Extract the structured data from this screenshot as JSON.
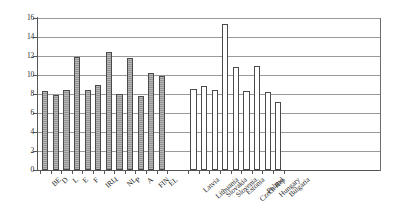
{
  "chart_data": {
    "type": "bar",
    "title": "",
    "xlabel": "",
    "ylabel": "",
    "ylim": [
      0,
      16
    ],
    "ytick_values": [
      0,
      2,
      4,
      6,
      8,
      10,
      12,
      14,
      16
    ],
    "ytick_labels": [
      "0",
      "2",
      "4",
      "6",
      "8",
      "10",
      "12",
      "14",
      "16"
    ],
    "grid": true,
    "legend": "none",
    "groups": [
      {
        "name": "EU Member States",
        "style": "filled-grey",
        "categories": [
          "BE",
          "D",
          "L",
          "E",
          "F",
          "IRL",
          "I",
          "NL",
          "P",
          "A",
          "FIN",
          "EL"
        ],
        "values": [
          8.3,
          7.9,
          8.4,
          11.9,
          8.4,
          8.9,
          12.4,
          8.0,
          11.8,
          7.8,
          10.2,
          9.9
        ]
      },
      {
        "name": "Candidate Countries",
        "style": "hollow-white",
        "categories": [
          "Latvia",
          "Lithuania",
          "Slovakia",
          "Slovenia",
          "Estonia",
          "Czech Rep",
          "Poland",
          "Hungary",
          "Bulgaria"
        ],
        "values": [
          8.5,
          8.8,
          8.4,
          15.4,
          10.8,
          8.3,
          11.0,
          8.2,
          7.2
        ]
      }
    ]
  }
}
